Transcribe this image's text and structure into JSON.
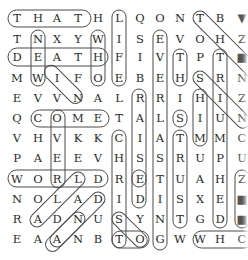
{
  "puzzle": {
    "type": "word-search",
    "grid_rows": [
      [
        "T",
        "H",
        "A",
        "T",
        "H",
        "L",
        "Q",
        "O",
        "N",
        "T",
        "B",
        "▼"
      ],
      [
        "T",
        "N",
        "X",
        "Y",
        "W",
        "I",
        "S",
        "E",
        "V",
        "O",
        "H",
        "Z"
      ],
      [
        "D",
        "E",
        "A",
        "T",
        "H",
        "F",
        "I",
        "V",
        "T",
        "P",
        "T",
        "■"
      ],
      [
        "M",
        "W",
        "I",
        "F",
        "O",
        "E",
        "B",
        "E",
        "H",
        "S",
        "R",
        "N"
      ],
      [
        "E",
        "V",
        "V",
        "N",
        "A",
        "L",
        "R",
        "R",
        "I",
        "H",
        "I",
        "Z"
      ],
      [
        "Q",
        "C",
        "O",
        "M",
        "E",
        "T",
        "A",
        "L",
        "S",
        "I",
        "U",
        "N"
      ],
      [
        "V",
        "H",
        "V",
        "K",
        "K",
        "C",
        "I",
        "A",
        "T",
        "M",
        "M",
        "C"
      ],
      [
        "P",
        "A",
        "E",
        "E",
        "V",
        "H",
        "S",
        "S",
        "R",
        "U",
        "P",
        "U"
      ],
      [
        "W",
        "O",
        "R",
        "L",
        "D",
        "R",
        "E",
        "T",
        "U",
        "A",
        "H",
        "Z"
      ],
      [
        "N",
        "O",
        "L",
        "A",
        "D",
        "I",
        "D",
        "I",
        "S",
        "X",
        "E",
        "■"
      ],
      [
        "R",
        "A",
        "D",
        "N",
        "U",
        "S",
        "Y",
        "N",
        "T",
        "G",
        "D",
        "■"
      ],
      [
        "E",
        "A",
        "A",
        "N",
        "B",
        "T",
        "O",
        "G",
        "W",
        "W",
        "H",
        "C"
      ]
    ],
    "found_words": [
      "THAT",
      "DEATH",
      "NEW",
      "WHO",
      "LIFE",
      "EVER",
      "TH",
      "COME",
      "OVER",
      "WORLD",
      "REAL",
      "RAISE",
      "SI",
      "HIM",
      "STRUT",
      "CHRIST",
      "RISE",
      "IS",
      "RED",
      "LASTING",
      "TRIUMPHED",
      "TO",
      "WH",
      "WIN",
      "DAN",
      "LAND",
      "ST",
      "SO",
      "TOSH"
    ]
  },
  "colors": {
    "letter": "#2a2a2a",
    "outline": "#4a4a4a",
    "background": "#ffffff"
  }
}
